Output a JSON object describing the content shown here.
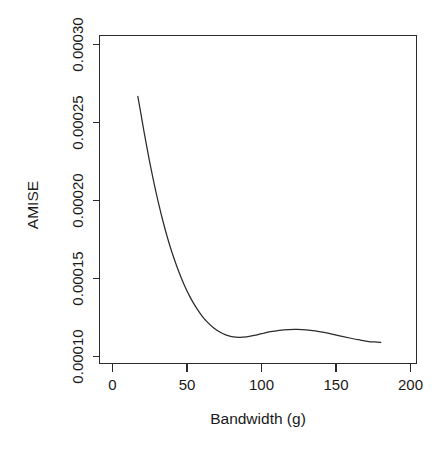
{
  "chart_data": {
    "type": "line",
    "title": "",
    "xlabel": "Bandwidth (g)",
    "ylabel": "AMISE",
    "xlim": [
      0,
      205
    ],
    "ylim": [
      9.68e-05,
      0.0003
    ],
    "grid": false,
    "legend": false,
    "xticks": [
      0,
      50,
      100,
      150,
      200
    ],
    "xticklabels": [
      "0",
      "50",
      "100",
      "150",
      "200"
    ],
    "yticks": [
      0.0001,
      0.00015,
      0.0002,
      0.00025,
      0.0003
    ],
    "yticklabels": [
      "0.00010",
      "0.00015",
      "0.00020",
      "0.00025",
      "0.00030"
    ],
    "series": [
      {
        "name": "AMISE(g)",
        "x": [
          17,
          19,
          21,
          23,
          25,
          28,
          31,
          34,
          37,
          40,
          44,
          48,
          52,
          56,
          60,
          64,
          68,
          72,
          76,
          80,
          85,
          90,
          95,
          100,
          106,
          112,
          118,
          124,
          130,
          136,
          142,
          148,
          154,
          160,
          166,
          172,
          176,
          180
        ],
        "y": [
          0.0002667,
          0.000256,
          0.000245,
          0.0002345,
          0.0002245,
          0.0002105,
          0.0001978,
          0.0001862,
          0.0001758,
          0.0001665,
          0.0001556,
          0.0001462,
          0.0001382,
          0.0001316,
          0.0001261,
          0.0001217,
          0.0001183,
          0.0001157,
          0.0001139,
          0.0001128,
          0.0001123,
          0.0001126,
          0.0001135,
          0.0001146,
          0.0001159,
          0.0001168,
          0.0001173,
          0.0001174,
          0.0001171,
          0.0001164,
          0.0001154,
          0.0001142,
          0.0001129,
          0.0001117,
          0.0001106,
          0.0001096,
          0.0001093,
          0.000109
        ]
      }
    ]
  },
  "axes": {
    "y_title": "AMISE",
    "x_title": "Bandwidth (g)"
  }
}
